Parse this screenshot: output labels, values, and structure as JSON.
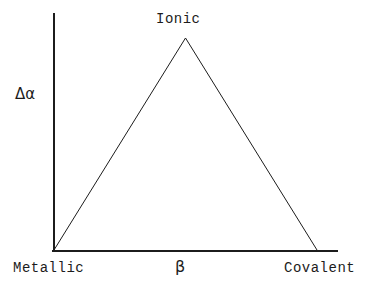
{
  "figure": {
    "kind": "bond-triangle-schematic",
    "background_color": "#ffffff",
    "line_color": "#1c1c1c",
    "text_color": "#1c1c1c"
  },
  "labels": {
    "apex": "Ionic",
    "y_axis": "Δα",
    "x_axis": "β",
    "x_left_end": "Metallic",
    "x_right_end": "Covalent"
  },
  "chart_data": {
    "type": "line",
    "title": "",
    "subtitle": "",
    "xlabel": "β",
    "ylabel": "Δα",
    "grid": false,
    "legend": null,
    "xlim": [
      0,
      1
    ],
    "ylim": [
      0,
      1
    ],
    "x_tick_labels": [
      "Metallic",
      "Covalent"
    ],
    "x_tick_positions": [
      0,
      1
    ],
    "y_tick_labels": [],
    "annotations": [
      {
        "text": "Ionic",
        "x": 0.5,
        "y": 1.0,
        "position": "above-apex"
      }
    ],
    "axes": {
      "y_axis_drawn": true,
      "x_axis_drawn": true,
      "y_axis_top_overshoot": true,
      "x_axis_right_overshoot": true
    },
    "series": [
      {
        "name": "Δα vs β",
        "x": [
          0,
          0.5,
          1
        ],
        "y": [
          0,
          1,
          0
        ],
        "shape": "triangular-peak"
      }
    ]
  }
}
